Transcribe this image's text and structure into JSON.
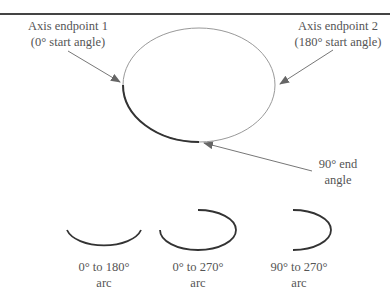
{
  "labels": {
    "endpoint1": {
      "line1": "Axis endpoint 1",
      "line2": "(0° start angle)"
    },
    "endpoint2": {
      "line1": "Axis endpoint 2",
      "line2": "(180° start angle)"
    },
    "end_angle": {
      "line1": "90° end",
      "line2": "angle"
    }
  },
  "arcs": [
    {
      "line1": "0° to 180°",
      "line2": "arc"
    },
    {
      "line1": "0° to 270°",
      "line2": "arc"
    },
    {
      "line1": "90° to 270°",
      "line2": "arc"
    }
  ],
  "colors": {
    "ellipse": "#888888",
    "arc": "#333333",
    "arrow": "#777777",
    "text": "#555555"
  }
}
